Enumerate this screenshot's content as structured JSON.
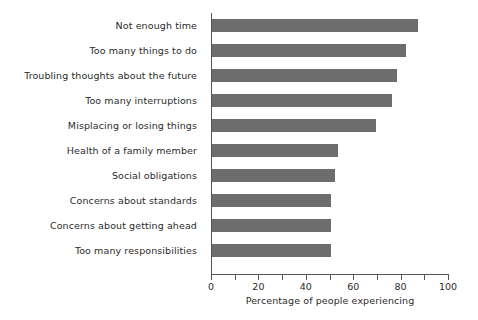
{
  "chart_data": {
    "type": "bar",
    "orientation": "horizontal",
    "title": "",
    "subtitle": "",
    "xlabel": "Percentage of people experiencing",
    "ylabel": "",
    "xlim": [
      0,
      100
    ],
    "xticks": [
      0,
      10,
      20,
      30,
      40,
      50,
      60,
      70,
      80,
      90,
      100
    ],
    "xtick_labels": [
      "0",
      "",
      "20",
      "",
      "40",
      "",
      "60",
      "",
      "80",
      "",
      "100"
    ],
    "grid": false,
    "legend": null,
    "bar_color": "#6d6d6d",
    "axis_color": "#555555",
    "text_color": "#2b2b2b",
    "categories": [
      "Not enough time",
      "Too many things to do",
      "Troubling thoughts about the future",
      "Too many interruptions",
      "Misplacing or losing things",
      "Health of a family member",
      "Social obligations",
      "Concerns about standards",
      "Concerns about getting ahead",
      "Too many responsibilities"
    ],
    "values": [
      87,
      82,
      78,
      76,
      69,
      53,
      52,
      50,
      50,
      50
    ]
  }
}
